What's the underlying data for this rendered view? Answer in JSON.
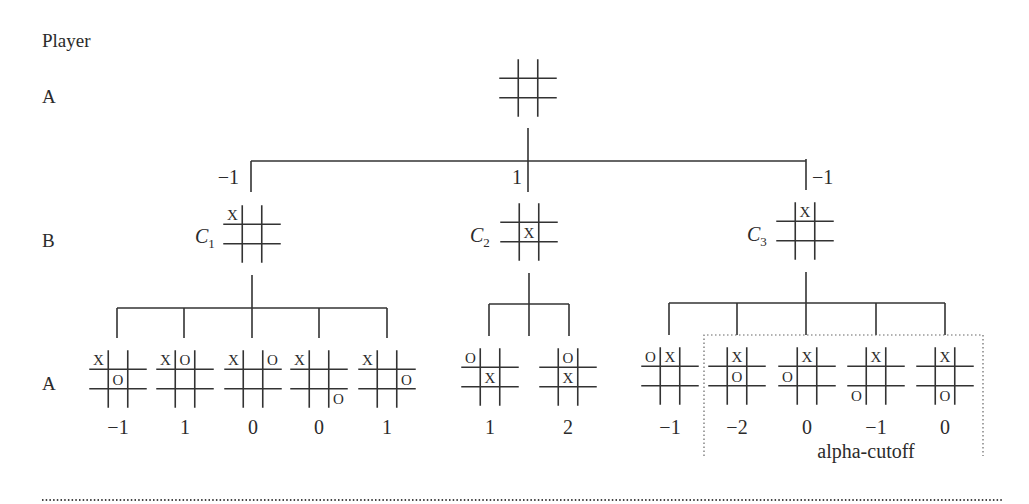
{
  "diagram": {
    "player_header": "Player",
    "level_labels": [
      {
        "text": "A",
        "x": 42,
        "y": 103
      },
      {
        "text": "B",
        "x": 42,
        "y": 247
      },
      {
        "text": "A",
        "x": 42,
        "y": 390
      }
    ],
    "root": {
      "board": {
        "cx": 528,
        "cy": 88,
        "cells": [
          "",
          "",
          "",
          "",
          "",
          "",
          "",
          "",
          ""
        ]
      },
      "stem": {
        "x": 528,
        "y1": 128,
        "y2": 161
      },
      "bar": {
        "x1": 251,
        "x2": 806,
        "y": 161
      }
    },
    "level1": [
      {
        "name": "C",
        "sub": "1",
        "value": "−1",
        "value_pos": {
          "x": 239,
          "y": 184,
          "anchor": "end"
        },
        "drop": {
          "x": 251,
          "y1": 161,
          "y2": 192
        },
        "board": {
          "cx": 252,
          "cy": 234,
          "cells": [
            "X",
            "",
            "",
            "",
            "",
            "",
            "",
            "",
            ""
          ]
        },
        "name_pos": {
          "x": 195,
          "y": 243
        },
        "stem": {
          "x": 252,
          "y1": 275,
          "y2": 308
        },
        "bar": {
          "x1": 117,
          "x2": 387,
          "y": 308
        },
        "children": [
          {
            "drop_x": 117,
            "board": {
              "cx": 118,
              "cy": 379,
              "cells": [
                "X",
                "",
                "",
                "",
                "O",
                "",
                "",
                "",
                ""
              ]
            },
            "value": "−1"
          },
          {
            "drop_x": 184,
            "board": {
              "cx": 185,
              "cy": 379,
              "cells": [
                "X",
                "O",
                "",
                "",
                "",
                "",
                "",
                "",
                ""
              ]
            },
            "value": "1"
          },
          {
            "drop_x": 252,
            "board": {
              "cx": 253,
              "cy": 379,
              "cells": [
                "X",
                "",
                "O",
                "",
                "",
                "",
                "",
                "",
                ""
              ]
            },
            "value": "0"
          },
          {
            "drop_x": 319,
            "board": {
              "cx": 319,
              "cy": 379,
              "cells": [
                "X",
                "",
                "",
                "",
                "",
                "",
                "",
                "",
                "O"
              ]
            },
            "value": "0"
          },
          {
            "drop_x": 387,
            "board": {
              "cx": 387,
              "cy": 379,
              "cells": [
                "X",
                "",
                "",
                "",
                "",
                "O",
                "",
                "",
                ""
              ]
            },
            "value": "1"
          }
        ],
        "child_drop_y2": 338
      },
      {
        "name": "C",
        "sub": "2",
        "value": "1",
        "value_pos": {
          "x": 522,
          "y": 184,
          "anchor": "end"
        },
        "drop": {
          "x": 528,
          "y1": 161,
          "y2": 192
        },
        "board": {
          "cx": 529,
          "cy": 232,
          "cells": [
            "",
            "",
            "",
            "",
            "X",
            "",
            "",
            "",
            ""
          ]
        },
        "name_pos": {
          "x": 470,
          "y": 242
        },
        "stem": {
          "x": 529,
          "y1": 273,
          "y2": 336
        },
        "bar": {
          "x1": 489,
          "x2": 569,
          "y": 304
        },
        "children": [
          {
            "drop_x": 489,
            "board": {
              "cx": 490,
              "cy": 377,
              "cells": [
                "O",
                "",
                "",
                "",
                "X",
                "",
                "",
                "",
                ""
              ]
            },
            "value": "1"
          },
          {
            "drop_x": 569,
            "board": {
              "cx": 568,
              "cy": 377,
              "cells": [
                "",
                "O",
                "",
                "",
                "X",
                "",
                "",
                "",
                ""
              ]
            },
            "value": "2"
          }
        ],
        "child_drop_y2": 336
      },
      {
        "name": "C",
        "sub": "3",
        "value": "−1",
        "value_pos": {
          "x": 812,
          "y": 184,
          "anchor": "start"
        },
        "drop": {
          "x": 806,
          "y1": 159,
          "y2": 190
        },
        "board": {
          "cx": 805,
          "cy": 231,
          "cells": [
            "",
            "X",
            "",
            "",
            "",
            "",
            "",
            "",
            ""
          ]
        },
        "name_pos": {
          "x": 747,
          "y": 241
        },
        "stem": {
          "x": 806,
          "y1": 272,
          "y2": 303
        },
        "bar": {
          "x1": 669,
          "x2": 945,
          "y": 303
        },
        "children": [
          {
            "drop_x": 669,
            "board": {
              "cx": 670,
              "cy": 376,
              "cells": [
                "O",
                "X",
                "",
                "",
                "",
                "",
                "",
                "",
                ""
              ]
            },
            "value": "−1"
          },
          {
            "drop_x": 737,
            "board": {
              "cx": 737,
              "cy": 376,
              "cells": [
                "",
                "X",
                "",
                "",
                "O",
                "",
                "",
                "",
                ""
              ]
            },
            "value": "−2"
          },
          {
            "drop_x": 806,
            "board": {
              "cx": 807,
              "cy": 376,
              "cells": [
                "",
                "X",
                "",
                "O",
                "",
                "",
                "",
                "",
                ""
              ]
            },
            "value": "0"
          },
          {
            "drop_x": 876,
            "board": {
              "cx": 876,
              "cy": 376,
              "cells": [
                "",
                "X",
                "",
                "",
                "",
                "",
                "O",
                "",
                ""
              ]
            },
            "value": "−1"
          },
          {
            "drop_x": 945,
            "board": {
              "cx": 945,
              "cy": 376,
              "cells": [
                "",
                "X",
                "",
                "",
                "",
                "",
                "",
                "O",
                ""
              ]
            },
            "value": "0"
          }
        ],
        "child_drop_y2": 335
      }
    ],
    "leaf_value_y": 434,
    "alpha_cutoff": {
      "label": "alpha-cutoff",
      "label_pos": {
        "x": 866,
        "y": 458
      },
      "box": {
        "x1": 704,
        "y1": 335,
        "x2": 983,
        "y2": 456
      }
    },
    "bottom_rule": {
      "x1": 42,
      "x2": 1003,
      "y": 500
    }
  }
}
